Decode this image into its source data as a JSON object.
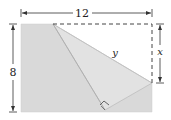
{
  "diagram": {
    "colors": {
      "paper_fill": "#d9d9d9",
      "folded_fill": "#e3e3e3",
      "fold_line": "#b3b3b3",
      "dim_line": "#333333",
      "dashed_outline": "#444444"
    },
    "labels": {
      "width": "12",
      "height": "8",
      "x": "x",
      "y": "y"
    },
    "annotations": {
      "right_angle_marker": "right-angle at folded corner"
    }
  }
}
